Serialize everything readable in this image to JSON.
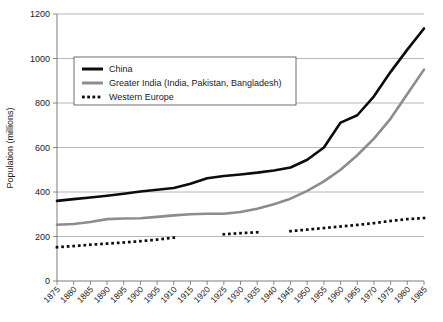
{
  "chart_data": {
    "type": "line",
    "title": "",
    "xlabel": "",
    "ylabel": "Population (millions)",
    "ylim": [
      0,
      1200
    ],
    "ytick_values": [
      0,
      200,
      400,
      600,
      800,
      1000,
      1200
    ],
    "ytick_labels": [
      "0",
      "200",
      "400",
      "600",
      "800",
      "1000",
      "1200"
    ],
    "grid": true,
    "legend_position": "upper-left",
    "x": [
      1875,
      1880,
      1885,
      1890,
      1895,
      1900,
      1905,
      1910,
      1915,
      1920,
      1925,
      1930,
      1935,
      1940,
      1945,
      1950,
      1955,
      1960,
      1965,
      1970,
      1975,
      1980,
      1985
    ],
    "xtick_labels": [
      "1875",
      "1880",
      "1885",
      "1890",
      "1895",
      "1900",
      "1905",
      "1910",
      "1915",
      "1920",
      "1925",
      "1930",
      "1935",
      "1940",
      "1945",
      "1950",
      "1955",
      "1960",
      "1965",
      "1970",
      "1975",
      "1980",
      "1985"
    ],
    "series": [
      {
        "name": "China",
        "color": "#0d0d0d",
        "width": 2.6,
        "style": "solid",
        "values": [
          360,
          368,
          375,
          383,
          392,
          402,
          410,
          418,
          437,
          462,
          472,
          479,
          487,
          497,
          510,
          545,
          600,
          712,
          745,
          830,
          940,
          1040,
          1135
        ]
      },
      {
        "name": "Greater India (India, Pakistan, Bangladesh)",
        "color": "#8c8c8c",
        "width": 2.6,
        "style": "solid",
        "values": [
          253,
          256,
          265,
          278,
          281,
          282,
          288,
          295,
          300,
          302,
          302,
          310,
          325,
          345,
          370,
          405,
          448,
          500,
          565,
          640,
          730,
          840,
          950
        ]
      },
      {
        "name": "Western Europe",
        "color": "#0d0d0d",
        "width": 2.6,
        "style": "dotted",
        "values": [
          152,
          157,
          163,
          168,
          173,
          179,
          186,
          195,
          null,
          null,
          210,
          215,
          219,
          null,
          224,
          231,
          238,
          245,
          252,
          260,
          270,
          278,
          283
        ]
      }
    ]
  },
  "legend": {
    "items": [
      {
        "label": "China"
      },
      {
        "label": "Greater India (India, Pakistan, Bangladesh)"
      },
      {
        "label": "Western Europe"
      }
    ]
  }
}
